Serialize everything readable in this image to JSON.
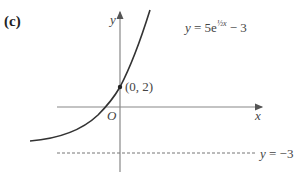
{
  "part_label": "(c)",
  "axes": {
    "x_label": "x",
    "y_label": "y",
    "origin_label": "O"
  },
  "curve": {
    "equation_prefix": "y = 5e",
    "exponent": "½x",
    "equation_suffix": " − 3",
    "color": "#333333"
  },
  "point": {
    "label": "(0, 2)",
    "x": 0,
    "y": 2
  },
  "asymptote": {
    "label": "y = −3",
    "value": -3
  }
}
